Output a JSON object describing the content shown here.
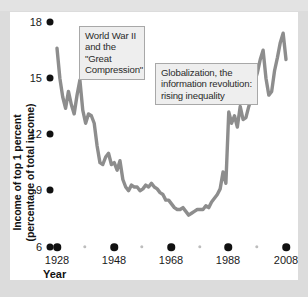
{
  "chart_data": {
    "type": "line",
    "title": "",
    "xlabel": "Year",
    "ylabel": "Income of top 1 percent (percentage of total income)",
    "ylabel_line1": "Income of top 1 percent",
    "ylabel_line2": "(percentage of total income)",
    "xlim": [
      1928,
      2008
    ],
    "ylim": [
      6,
      18
    ],
    "yticks": [
      18,
      15,
      12,
      9,
      6
    ],
    "xticks": [
      1928,
      1948,
      1968,
      1988,
      2008
    ],
    "xticks_minor": [
      1938,
      1958,
      1978,
      1998
    ],
    "grid": false,
    "legend": false,
    "line_color": "#8d8d8d",
    "annotations": [
      {
        "id": "ww2",
        "text": "World War II and the \"Great Compression\"",
        "lines": [
          "World War II",
          "and the \"Great",
          "Compression\""
        ]
      },
      {
        "id": "globalization",
        "text": "Globalization, the information revolution: rising inequality",
        "lines": [
          "Globalization, the",
          "information revolution:",
          "rising inequality"
        ]
      }
    ],
    "series": [
      {
        "name": "Income share of top 1 percent",
        "x": [
          1928,
          1929,
          1930,
          1931,
          1932,
          1933,
          1934,
          1935,
          1936,
          1937,
          1938,
          1939,
          1940,
          1941,
          1942,
          1943,
          1944,
          1945,
          1946,
          1947,
          1948,
          1949,
          1950,
          1951,
          1952,
          1953,
          1954,
          1955,
          1956,
          1957,
          1958,
          1959,
          1960,
          1961,
          1962,
          1963,
          1964,
          1965,
          1966,
          1967,
          1968,
          1969,
          1970,
          1971,
          1972,
          1973,
          1974,
          1975,
          1976,
          1977,
          1978,
          1979,
          1980,
          1981,
          1982,
          1983,
          1984,
          1985,
          1986,
          1987,
          1988,
          1989,
          1990,
          1991,
          1992,
          1993,
          1994,
          1995,
          1996,
          1997,
          1998,
          1999,
          2000,
          2001,
          2002,
          2003,
          2004,
          2005,
          2006,
          2007,
          2008
        ],
        "values": [
          16.6,
          15.0,
          14.0,
          13.4,
          14.3,
          13.6,
          13.1,
          14.1,
          14.9,
          13.3,
          12.6,
          13.1,
          13.0,
          12.6,
          11.4,
          10.5,
          10.4,
          10.8,
          11.0,
          10.4,
          10.5,
          10.1,
          10.6,
          9.6,
          9.2,
          9.0,
          9.3,
          9.2,
          9.2,
          9.0,
          9.1,
          9.3,
          9.2,
          9.4,
          9.2,
          9.1,
          8.9,
          8.8,
          8.5,
          8.5,
          8.3,
          8.1,
          8.0,
          8.0,
          8.1,
          7.9,
          7.7,
          7.8,
          7.9,
          8.0,
          8.0,
          8.0,
          8.2,
          8.1,
          8.4,
          8.6,
          8.8,
          9.1,
          10.0,
          9.4,
          13.2,
          12.6,
          13.0,
          12.4,
          13.5,
          12.8,
          12.9,
          13.5,
          14.0,
          14.8,
          15.3,
          16.0,
          16.5,
          15.0,
          14.1,
          14.3,
          15.4,
          16.1,
          16.9,
          17.4,
          16.0
        ],
        "units": "percent"
      }
    ],
    "data_note_start_value": "16.6",
    "data_note_end_value": "16.0"
  }
}
